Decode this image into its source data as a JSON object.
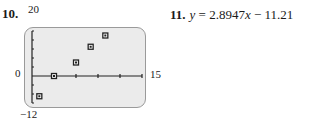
{
  "problem10": {
    "number": "10.",
    "window": {
      "ymax_label": "20",
      "ymin_label": "−12",
      "xmax_label": "15",
      "origin_label": "0"
    }
  },
  "problem11": {
    "number": "11.",
    "lhs": "y",
    "equals": " = 2.8947",
    "x": "x",
    "rest": " − 11.211"
  },
  "chart_data": {
    "type": "scatter",
    "title": "",
    "xlabel": "",
    "ylabel": "",
    "xlim": [
      0,
      15
    ],
    "ylim": [
      -12,
      20
    ],
    "xticks_step": 3,
    "yticks_step": 4,
    "grid": false,
    "marker": "square",
    "x": [
      1,
      3,
      6,
      8,
      10
    ],
    "y": [
      -9,
      0,
      6,
      13,
      18
    ],
    "tick_labels": {
      "ymax": "20",
      "ymin": "-12",
      "xmax": "15",
      "origin": "0"
    },
    "annotation": "11. y = 2.8947x - 11.211"
  }
}
